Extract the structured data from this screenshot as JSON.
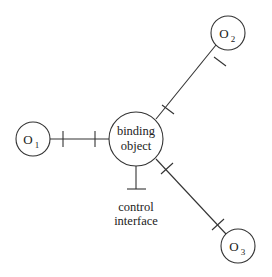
{
  "diagram": {
    "type": "binding-object-diagram",
    "center_node": {
      "label_line1": "binding",
      "label_line2": "object"
    },
    "nodes": [
      {
        "id": "o1",
        "label": "O",
        "subscript": "1"
      },
      {
        "id": "o2",
        "label": "O",
        "subscript": "2"
      },
      {
        "id": "o3",
        "label": "O",
        "subscript": "3"
      }
    ],
    "control_interface": {
      "label_line1": "control",
      "label_line2": "interface"
    },
    "edges": [
      {
        "from": "o1",
        "to": "binding object"
      },
      {
        "from": "o2",
        "to": "binding object"
      },
      {
        "from": "o3",
        "to": "binding object"
      }
    ]
  }
}
